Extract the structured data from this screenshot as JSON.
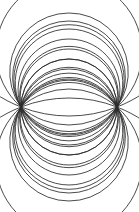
{
  "figure": {
    "title": "Coaxial circle pencil",
    "background_color": "#ffffff",
    "stroke_color": "#2b2b2b",
    "stroke_width": 0.85,
    "canvas_width": 139,
    "canvas_height": 212
  },
  "chart_data": {
    "type": "line",
    "title": "Coaxial circle pencil",
    "subtitle": "",
    "xlabel": "",
    "ylabel": "",
    "xlim": [
      0,
      139
    ],
    "ylim": [
      0,
      212
    ],
    "grid": false,
    "legend": "none",
    "annotations": [],
    "tick_labels": {
      "x": [],
      "y": []
    },
    "base_points": [
      {
        "name": "left-node",
        "x": 21,
        "y": 107
      },
      {
        "name": "right-node",
        "x": 117,
        "y": 107
      }
    ],
    "half_chord": 48,
    "center_x": 69,
    "center_y": 107,
    "curve_count_upper": 10,
    "curve_count_lower": 10,
    "curve_count_total": 20,
    "series": [
      {
        "name": "upper-1",
        "lobe": "upper",
        "index": 1,
        "sagitta": 9,
        "radius": 132.5,
        "center_y": 230.5,
        "apex_x": 69,
        "apex_y": 98
      },
      {
        "name": "upper-2",
        "lobe": "upper",
        "index": 2,
        "sagitta": 18,
        "radius": 73.0,
        "center_y": 162.0,
        "apex_x": 69,
        "apex_y": 89
      },
      {
        "name": "upper-3",
        "lobe": "upper",
        "index": 3,
        "sagitta": 28,
        "radius": 55.1,
        "center_y": 134.1,
        "apex_x": 69,
        "apex_y": 79
      },
      {
        "name": "upper-4",
        "lobe": "upper",
        "index": 4,
        "sagitta": 38,
        "radius": 49.3,
        "center_y": 118.3,
        "apex_x": 69,
        "apex_y": 69
      },
      {
        "name": "upper-5",
        "lobe": "upper",
        "index": 5,
        "sagitta": 48,
        "radius": 48.0,
        "center_y": 107.0,
        "apex_x": 69,
        "apex_y": 59
      },
      {
        "name": "upper-6",
        "lobe": "upper",
        "index": 6,
        "sagitta": 58,
        "radius": 48.9,
        "center_y": 97.9,
        "apex_x": 69,
        "apex_y": 49
      },
      {
        "name": "upper-7",
        "lobe": "upper",
        "index": 7,
        "sagitta": 68,
        "radius": 50.9,
        "center_y": 90.9,
        "apex_x": 69,
        "apex_y": 39
      },
      {
        "name": "upper-8",
        "lobe": "upper",
        "index": 8,
        "sagitta": 78,
        "radius": 53.8,
        "center_y": 84.8,
        "apex_x": 69,
        "apex_y": 29
      },
      {
        "name": "upper-9",
        "lobe": "upper",
        "index": 9,
        "sagitta": 86,
        "radius": 56.4,
        "center_y": 80.4,
        "apex_x": 69,
        "apex_y": 21
      },
      {
        "name": "upper-10",
        "lobe": "upper",
        "index": 10,
        "sagitta": 94,
        "radius": 59.3,
        "center_y": 76.3,
        "apex_x": 69,
        "apex_y": 13
      },
      {
        "name": "lower-1",
        "lobe": "lower",
        "index": 1,
        "sagitta": 9,
        "radius": 132.5,
        "center_y": -16.5,
        "apex_x": 69,
        "apex_y": 116
      },
      {
        "name": "lower-2",
        "lobe": "lower",
        "index": 2,
        "sagitta": 18,
        "radius": 73.0,
        "center_y": 52.0,
        "apex_x": 69,
        "apex_y": 125
      },
      {
        "name": "lower-3",
        "lobe": "lower",
        "index": 3,
        "sagitta": 28,
        "radius": 55.1,
        "center_y": 79.9,
        "apex_x": 69,
        "apex_y": 135
      },
      {
        "name": "lower-4",
        "lobe": "lower",
        "index": 4,
        "sagitta": 38,
        "radius": 49.3,
        "center_y": 95.7,
        "apex_x": 69,
        "apex_y": 145
      },
      {
        "name": "lower-5",
        "lobe": "lower",
        "index": 5,
        "sagitta": 48,
        "radius": 48.0,
        "center_y": 107.0,
        "apex_x": 69,
        "apex_y": 155
      },
      {
        "name": "lower-6",
        "lobe": "lower",
        "index": 6,
        "sagitta": 58,
        "radius": 48.9,
        "center_y": 116.1,
        "apex_x": 69,
        "apex_y": 165
      },
      {
        "name": "lower-7",
        "lobe": "lower",
        "index": 7,
        "sagitta": 68,
        "radius": 50.9,
        "center_y": 123.1,
        "apex_x": 69,
        "apex_y": 175
      },
      {
        "name": "lower-8",
        "lobe": "lower",
        "index": 8,
        "sagitta": 78,
        "radius": 53.8,
        "center_y": 129.2,
        "apex_x": 69,
        "apex_y": 185
      },
      {
        "name": "lower-9",
        "lobe": "lower",
        "index": 9,
        "sagitta": 86,
        "radius": 56.4,
        "center_y": 133.6,
        "apex_x": 69,
        "apex_y": 193
      },
      {
        "name": "lower-10",
        "lobe": "lower",
        "index": 10,
        "sagitta": 94,
        "radius": 59.3,
        "center_y": 137.7,
        "apex_x": 69,
        "apex_y": 201
      }
    ]
  }
}
